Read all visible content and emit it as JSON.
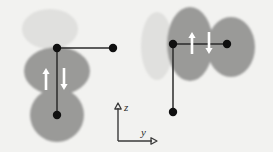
{
  "figure": {
    "background_color": "#f2f2f0",
    "width": 273,
    "height": 152,
    "palette": {
      "light_lobe": "#e0e0de",
      "dark_lobe": "#9a9a98",
      "bond": "#2b2b2b",
      "node_dot": "#101010",
      "spin_arrow": "#ffffff",
      "axis": "#3a3a3a",
      "label_text": "#2b2b2b"
    }
  },
  "axes": {
    "name": "coordinate-axes",
    "vertical": {
      "label": "z",
      "direction": "up",
      "x": 118,
      "y_top": 103,
      "y_bottom": 141
    },
    "horizontal": {
      "label": "y",
      "direction": "right",
      "y": 141,
      "x_left": 118,
      "x_right": 157
    },
    "z_label": "z",
    "y_label": "y"
  },
  "panels": [
    {
      "name": "left-configuration",
      "id": "panel-left",
      "orientation": "vertical-bond",
      "lobes": [
        {
          "name": "upper-light-lobe",
          "shade": "light",
          "cx": 50,
          "cy": 29,
          "rx": 28,
          "ry": 20,
          "rotation": 0
        },
        {
          "name": "middle-dark-lobe",
          "shade": "dark",
          "cx": 57,
          "cy": 71,
          "rx": 33,
          "ry": 24,
          "rotation": 0
        },
        {
          "name": "lower-dark-lobe",
          "shade": "dark",
          "cx": 57,
          "cy": 115,
          "rx": 27,
          "ry": 27,
          "rotation": 0
        }
      ],
      "bonds": [
        {
          "name": "vertical-bond",
          "x1": 57,
          "y1": 48,
          "x2": 57,
          "y2": 115
        },
        {
          "name": "horizontal-bond",
          "x1": 57,
          "y1": 48,
          "x2": 113,
          "y2": 48
        }
      ],
      "nodes": [
        {
          "name": "top-node-dot",
          "cx": 57,
          "cy": 48,
          "r": 4.2
        },
        {
          "name": "right-node-dot",
          "cx": 113,
          "cy": 48,
          "r": 4.2
        },
        {
          "name": "bottom-node-dot",
          "cx": 57,
          "cy": 115,
          "r": 4.2
        }
      ],
      "spins": [
        {
          "name": "spin-up-arrow",
          "direction": "up",
          "symbol": "↑",
          "x": 46,
          "y_top": 68,
          "y_bottom": 90
        },
        {
          "name": "spin-down-arrow",
          "direction": "down",
          "symbol": "↓",
          "x": 64,
          "y_top": 68,
          "y_bottom": 90
        }
      ]
    },
    {
      "name": "right-configuration",
      "id": "panel-right",
      "orientation": "horizontal-bond",
      "lobes": [
        {
          "name": "left-light-lobe",
          "shade": "light",
          "cx": 157,
          "cy": 46,
          "rx": 16,
          "ry": 34,
          "rotation": 0
        },
        {
          "name": "middle-dark-lobe",
          "shade": "dark",
          "cx": 190,
          "cy": 44,
          "rx": 23,
          "ry": 37,
          "rotation": 0
        },
        {
          "name": "right-dark-lobe",
          "shade": "dark",
          "cx": 231,
          "cy": 47,
          "rx": 24,
          "ry": 30,
          "rotation": 0
        }
      ],
      "bonds": [
        {
          "name": "horizontal-bond",
          "x1": 173,
          "y1": 44,
          "x2": 227,
          "y2": 44
        },
        {
          "name": "vertical-bond",
          "x1": 173,
          "y1": 44,
          "x2": 173,
          "y2": 112
        }
      ],
      "nodes": [
        {
          "name": "left-node-dot",
          "cx": 173,
          "cy": 44,
          "r": 4.2
        },
        {
          "name": "right-node-dot",
          "cx": 227,
          "cy": 44,
          "r": 4.2
        },
        {
          "name": "bottom-node-dot",
          "cx": 173,
          "cy": 112,
          "r": 4.2
        }
      ],
      "spins": [
        {
          "name": "spin-up-arrow",
          "direction": "up",
          "symbol": "↑",
          "x": 192,
          "y_top": 32,
          "y_bottom": 54
        },
        {
          "name": "spin-down-arrow",
          "direction": "down",
          "symbol": "↓",
          "x": 209,
          "y_top": 32,
          "y_bottom": 54
        }
      ]
    }
  ]
}
